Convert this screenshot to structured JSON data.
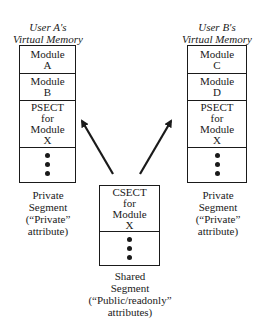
{
  "user_a": {
    "heading": [
      "User A's",
      "Virtual Memory"
    ],
    "cells": [
      {
        "lines": [
          "Module",
          "A"
        ]
      },
      {
        "lines": [
          "Module",
          "B"
        ]
      },
      {
        "lines": [
          "PSECT",
          "for",
          "Module",
          "X"
        ]
      },
      {
        "dots": 3
      }
    ],
    "caption": [
      "Private",
      "Segment",
      "(“Private”",
      "attribute)"
    ]
  },
  "user_b": {
    "heading": [
      "User B's",
      "Virtual Memory"
    ],
    "cells": [
      {
        "lines": [
          "Module",
          "C"
        ]
      },
      {
        "lines": [
          "Module",
          "D"
        ]
      },
      {
        "lines": [
          "PSECT",
          "for",
          "Module",
          "X"
        ]
      },
      {
        "dots": 3
      }
    ],
    "caption": [
      "Private",
      "Segment",
      "(“Private”",
      "attribute)"
    ]
  },
  "shared": {
    "cells": [
      {
        "lines": [
          "CSECT",
          "for",
          "Module",
          "X"
        ]
      },
      {
        "dots": 3
      }
    ],
    "caption": [
      "Shared",
      "Segment",
      "(“Public/readonly”",
      "attributes)"
    ]
  },
  "arrows": [
    {
      "from": "shared",
      "to": "user_a.psect"
    },
    {
      "from": "shared",
      "to": "user_b.psect"
    }
  ]
}
